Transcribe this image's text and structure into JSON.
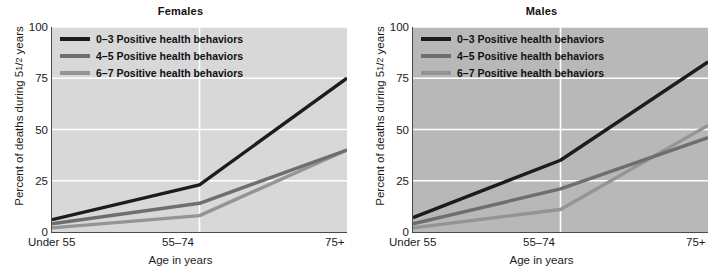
{
  "figure": {
    "width": 722,
    "height": 277,
    "background": "#ffffff"
  },
  "chart_data": [
    {
      "type": "line",
      "title": "Females",
      "xlabel": "Age in years",
      "ylabel": "Percent of deaths during 5½ years",
      "ylabel_prefix": "Percent of deaths during 5",
      "ylabel_fraction": "1/2",
      "ylabel_suffix": " years",
      "categories": [
        "Under 55",
        "55–74",
        "75+"
      ],
      "ylim": [
        0,
        100
      ],
      "yticks": [
        0,
        25,
        50,
        75,
        100
      ],
      "grid": true,
      "grid_color": "#ffffff",
      "plot_background": "#d8d8d8",
      "legend_position": "top-left",
      "series": [
        {
          "name": "0–3 Positive health behaviors",
          "values": [
            6,
            23,
            75
          ],
          "color": "#1c1c1c",
          "width": 3.4
        },
        {
          "name": "4–5 Positive health behaviors",
          "values": [
            4,
            14,
            40
          ],
          "color": "#6e6e6e",
          "width": 3.4
        },
        {
          "name": "6–7 Positive health behaviors",
          "values": [
            2,
            8,
            40
          ],
          "color": "#949494",
          "width": 3.4
        }
      ]
    },
    {
      "type": "line",
      "title": "Males",
      "xlabel": "Age in years",
      "ylabel": "Percent of deaths during 5½ years",
      "ylabel_prefix": "Percent of deaths during 5",
      "ylabel_fraction": "1/2",
      "ylabel_suffix": " years",
      "categories": [
        "Under 55",
        "55–74",
        "75+"
      ],
      "ylim": [
        0,
        100
      ],
      "yticks": [
        0,
        25,
        50,
        75,
        100
      ],
      "grid": true,
      "grid_color": "#ffffff",
      "plot_background": "#b8b8b8",
      "legend_position": "top-left",
      "series": [
        {
          "name": "0–3 Positive health behaviors",
          "values": [
            7,
            35,
            83
          ],
          "color": "#1c1c1c",
          "width": 3.4
        },
        {
          "name": "4–5 Positive health behaviors",
          "values": [
            4,
            21,
            46
          ],
          "color": "#6e6e6e",
          "width": 3.4
        },
        {
          "name": "6–7 Positive health behaviors",
          "values": [
            2,
            11,
            52
          ],
          "color": "#949494",
          "width": 3.4
        }
      ]
    }
  ]
}
